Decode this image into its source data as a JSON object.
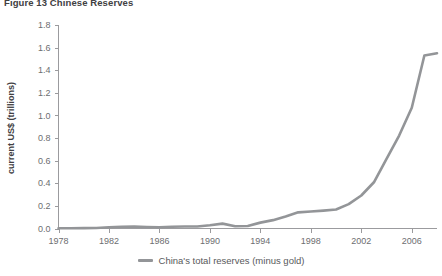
{
  "chart_data": {
    "type": "line",
    "title": "Figure 13 Chinese Reserves",
    "subtitle": "",
    "xlabel": "",
    "ylabel": "current US$ (trillions)",
    "xlim": [
      1978,
      2008
    ],
    "ylim": [
      0.0,
      1.8
    ],
    "grid": false,
    "legend_position": "bottom-center",
    "y_ticks": [
      "0.0",
      "0.2",
      "0.4",
      "0.6",
      "0.8",
      "1.0",
      "1.2",
      "1.4",
      "1.6",
      "1.8"
    ],
    "y_tick_values": [
      0.0,
      0.2,
      0.4,
      0.6,
      0.8,
      1.0,
      1.2,
      1.4,
      1.6,
      1.8
    ],
    "x_ticks": [
      "1978",
      "1982",
      "1986",
      "1990",
      "1994",
      "1998",
      "2002",
      "2006"
    ],
    "x_tick_values": [
      1978,
      1982,
      1986,
      1990,
      1994,
      1998,
      2002,
      2006
    ],
    "x": [
      1978,
      1979,
      1980,
      1981,
      1982,
      1983,
      1984,
      1985,
      1986,
      1987,
      1988,
      1989,
      1990,
      1991,
      1992,
      1993,
      1994,
      1995,
      1996,
      1997,
      1998,
      1999,
      2000,
      2001,
      2002,
      2003,
      2004,
      2005,
      2006,
      2007,
      2008
    ],
    "series": [
      {
        "name": "China's total reserves (minus gold)",
        "color": "#939598",
        "values": [
          0.002,
          0.002,
          0.003,
          0.005,
          0.011,
          0.015,
          0.017,
          0.013,
          0.011,
          0.016,
          0.018,
          0.018,
          0.029,
          0.043,
          0.02,
          0.022,
          0.052,
          0.074,
          0.107,
          0.143,
          0.15,
          0.158,
          0.168,
          0.216,
          0.292,
          0.409,
          0.615,
          0.822,
          1.068,
          1.53,
          1.55
        ]
      }
    ],
    "legend": [
      {
        "label": "China's total reserves (minus gold)",
        "color": "#939598"
      }
    ]
  },
  "axis": {
    "ylabel": "current US$ (trillions)"
  }
}
